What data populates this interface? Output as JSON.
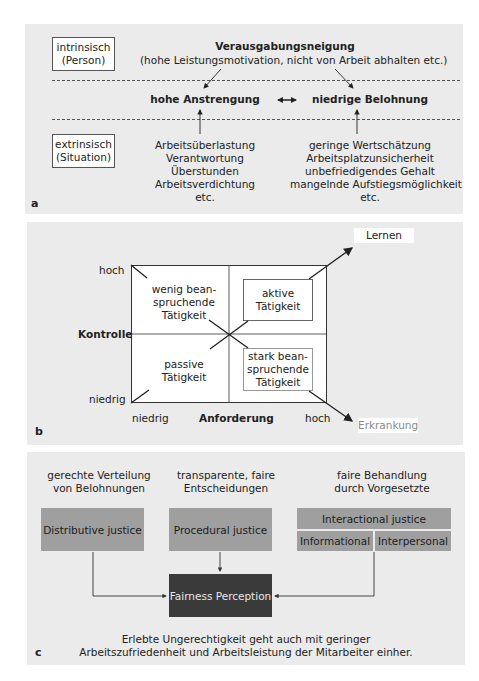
{
  "panel_a": {
    "letter": "a",
    "intrinsic_box": {
      "line1": "intrinsisch",
      "line2": "(Person)"
    },
    "extrinsic_box": {
      "line1": "extrinsisch",
      "line2": "(Situation)"
    },
    "top_title": "Verausgabungsneigung",
    "top_subtitle": "(hohe Leistungsmotivation, nicht von Arbeit abhalten etc.)",
    "left_node": "hohe Anstrengung",
    "right_node": "niedrige Belohnung",
    "left_factors": [
      "Arbeitsüberlastung",
      "Verantwortung",
      "Überstunden",
      "Arbeitsverdichtung",
      "etc."
    ],
    "right_factors": [
      "geringe Wertschätzung",
      "Arbeitsplatzunsicherheit",
      "unbefriedigendes Gehalt",
      "mangelnde Aufstiegsmöglichkeit",
      "etc."
    ]
  },
  "panel_b": {
    "letter": "b",
    "y_axis_label": "Kontrolle",
    "y_high": "hoch",
    "y_low": "niedrig",
    "x_axis_label": "Anforderung",
    "x_low": "niedrig",
    "x_high": "hoch",
    "quadrants": {
      "top_left": [
        "wenig bean-",
        "spruchende",
        "Tätigkeit"
      ],
      "top_right": [
        "aktive",
        "Tätigkeit"
      ],
      "bottom_left": [
        "passive",
        "Tätigkeit"
      ],
      "bottom_right": [
        "stark bean-",
        "spruchende",
        "Tätigkeit"
      ]
    },
    "outcome_top": "Lernen",
    "outcome_bottom": "Erkrankung"
  },
  "panel_c": {
    "letter": "c",
    "headers": [
      {
        "line1": "gerechte Verteilung",
        "line2": "von Belohnungen"
      },
      {
        "line1": "transparente, faire",
        "line2": "Entscheidungen"
      },
      {
        "line1": "faire Behandlung",
        "line2": "durch Vorgesetzte"
      }
    ],
    "boxes": {
      "distributive": "Distributive justice",
      "procedural": "Procedural justice",
      "interactional": "Interactional justice",
      "informational": "Informational",
      "interpersonal": "Interpersonal",
      "fairness": "Fairness Perception"
    },
    "caption_line1": "Erlebte Ungerechtigkeit geht auch mit geringer",
    "caption_line2": "Arbeitszufriedenheit und Arbeitsleistung der Mitarbeiter einher."
  },
  "colors": {
    "panel_bg": "#ebebeb",
    "justice_box": "#9f9f9f",
    "fairness_box": "#3a3a3a",
    "erkrankung_text": "#8a8a8a"
  }
}
